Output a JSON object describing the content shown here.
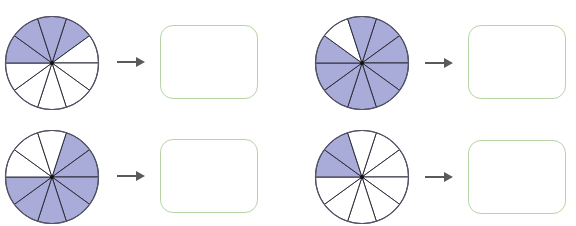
{
  "colors": {
    "shaded": "#a9abd8",
    "unshaded": "#ffffff",
    "stroke": "#2d2d3a",
    "arrow": "#5a5a5a",
    "box_border": "#b6d4a6"
  },
  "exercises": [
    {
      "slices": 10,
      "shaded": [
        7,
        8,
        9,
        0
      ],
      "fraction": "4/10",
      "answer": ""
    },
    {
      "slices": 10,
      "shaded": [
        0,
        1,
        2,
        3,
        4,
        5,
        6,
        7,
        9
      ],
      "fraction": "9/10",
      "answer": ""
    },
    {
      "slices": 10,
      "shaded": [
        0,
        1,
        2,
        3,
        4,
        5,
        6
      ],
      "fraction": "7/10",
      "answer": ""
    },
    {
      "slices": 10,
      "shaded": [
        7,
        8
      ],
      "fraction": "2/10",
      "answer": ""
    }
  ]
}
